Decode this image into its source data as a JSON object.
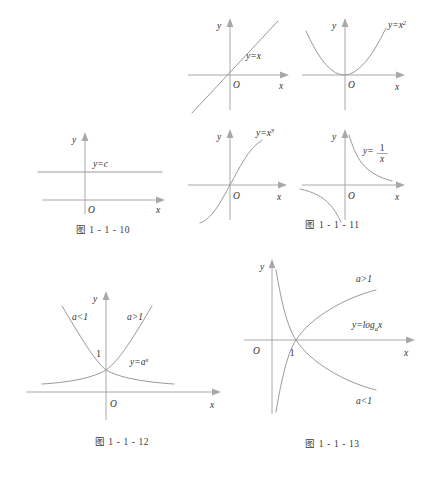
{
  "page": {
    "background_color": "#ffffff",
    "axis_color": "#a8a8a8",
    "curve_color": "#9a9a9a",
    "text_color": "#333333"
  },
  "figures": [
    {
      "id": "fig-1-1-10",
      "caption": "图 1 - 1 - 10",
      "x_axis_label": "x",
      "y_axis_label": "y",
      "origin_label": "O",
      "curves": [
        {
          "label_plain": "y=c",
          "label_html": "y=c"
        }
      ]
    },
    {
      "id": "fig-1-1-11-a",
      "caption": "",
      "x_axis_label": "x",
      "y_axis_label": "y",
      "origin_label": "O",
      "curves": [
        {
          "label_plain": "y=x",
          "label_html": "y=x"
        }
      ]
    },
    {
      "id": "fig-1-1-11-b",
      "caption": "",
      "x_axis_label": "x",
      "y_axis_label": "y",
      "origin_label": "O",
      "curves": [
        {
          "label_plain": "y=x2",
          "label_base": "y=x",
          "label_sup": "2"
        }
      ]
    },
    {
      "id": "fig-1-1-11-c",
      "caption": "",
      "x_axis_label": "x",
      "y_axis_label": "y",
      "origin_label": "O",
      "curves": [
        {
          "label_plain": "y=x3",
          "label_base": "y=x",
          "label_sup": "3"
        }
      ]
    },
    {
      "id": "fig-1-1-11-d",
      "caption": "图 1 - 1 - 11",
      "x_axis_label": "x",
      "y_axis_label": "y",
      "origin_label": "O",
      "curves": [
        {
          "label_plain": "y=1/x",
          "label_lhs": "y=",
          "label_num": "1",
          "label_den": "x"
        }
      ]
    },
    {
      "id": "fig-1-1-12",
      "caption": "图 1 - 1 - 12",
      "x_axis_label": "x",
      "y_axis_label": "y",
      "origin_label": "O",
      "intercept_label": "1",
      "curves": [
        {
          "label_plain": "a<1"
        },
        {
          "label_plain": "a>1"
        },
        {
          "label_plain": "y=a^x",
          "label_base": "y=a",
          "label_sup": "x"
        }
      ]
    },
    {
      "id": "fig-1-1-13",
      "caption": "图 1 - 1 - 13",
      "x_axis_label": "x",
      "y_axis_label": "y",
      "origin_label": "O",
      "intercept_label": "1",
      "curves": [
        {
          "label_plain": "a>1"
        },
        {
          "label_plain": "a<1"
        },
        {
          "label_plain": "y=log_a x",
          "label_base": "y=log",
          "label_sub": "a",
          "label_tail": "x"
        }
      ]
    }
  ]
}
